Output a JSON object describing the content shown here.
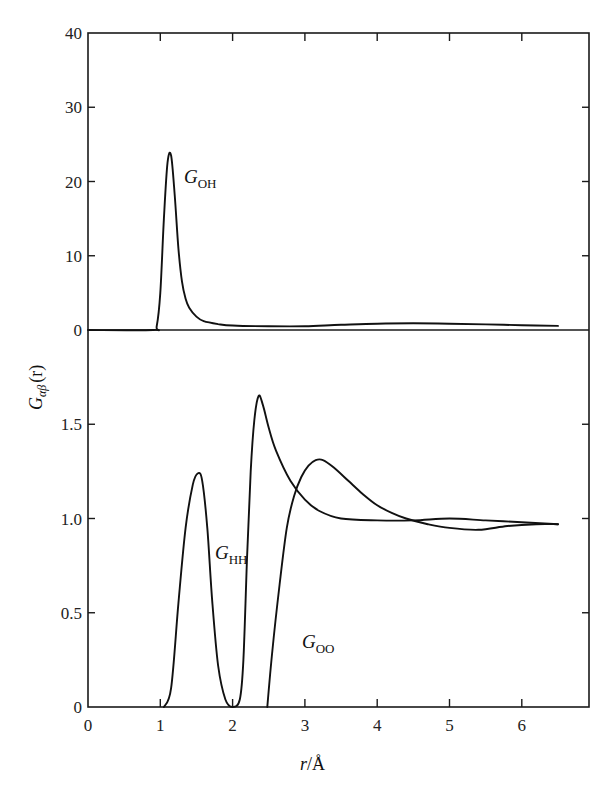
{
  "chart_data": {
    "type": "line",
    "title": "",
    "xlabel": "r/Å",
    "ylabel": "G_αβ(r)",
    "xlim": [
      0,
      6.5
    ],
    "x_ticks": [
      "0",
      "1",
      "2",
      "3",
      "4",
      "5",
      "6"
    ],
    "grid": false,
    "legend": "inline labels next to curves",
    "panels": [
      {
        "name": "upper",
        "ylim": [
          0,
          40
        ],
        "y_ticks": [
          "0",
          "10",
          "20",
          "30",
          "40"
        ],
        "series": [
          {
            "name": "G_OH",
            "label_main": "G",
            "label_sub": "OH",
            "x": [
              0.0,
              0.9,
              0.95,
              1.0,
              1.05,
              1.1,
              1.15,
              1.2,
              1.25,
              1.3,
              1.35,
              1.4,
              1.5,
              1.6,
              1.8,
              2.0,
              2.5,
              3.0,
              3.5,
              4.0,
              4.5,
              5.0,
              5.5,
              6.0,
              6.5
            ],
            "y": [
              0.0,
              0.0,
              0.5,
              5.0,
              15.0,
              22.5,
              23.5,
              18.0,
              11.0,
              6.5,
              4.2,
              3.0,
              1.8,
              1.2,
              0.8,
              0.6,
              0.5,
              0.5,
              0.7,
              0.85,
              0.9,
              0.85,
              0.75,
              0.65,
              0.55
            ]
          }
        ]
      },
      {
        "name": "lower",
        "ylim": [
          0,
          2.0
        ],
        "y_ticks": [
          "0",
          "0.5",
          "1.0",
          "1.5"
        ],
        "series": [
          {
            "name": "G_HH",
            "label_main": "G",
            "label_sub": "HH",
            "x": [
              1.05,
              1.15,
              1.25,
              1.35,
              1.45,
              1.52,
              1.58,
              1.65,
              1.72,
              1.8,
              1.9,
              2.0,
              2.1,
              2.15,
              2.2,
              2.25,
              2.3,
              2.36,
              2.42,
              2.5,
              2.6,
              2.8,
              3.0,
              3.2,
              3.5,
              4.0,
              4.5,
              5.0,
              5.5,
              6.0,
              6.5
            ],
            "y": [
              0.0,
              0.1,
              0.55,
              0.95,
              1.18,
              1.24,
              1.2,
              0.95,
              0.55,
              0.22,
              0.04,
              0.0,
              0.04,
              0.25,
              0.8,
              1.25,
              1.52,
              1.65,
              1.6,
              1.48,
              1.36,
              1.2,
              1.1,
              1.04,
              1.0,
              0.99,
              0.99,
              1.0,
              0.99,
              0.98,
              0.97
            ]
          },
          {
            "name": "G_OO",
            "label_main": "G",
            "label_sub": "OO",
            "x": [
              2.48,
              2.55,
              2.65,
              2.75,
              2.85,
              2.95,
              3.05,
              3.15,
              3.25,
              3.4,
              3.6,
              3.8,
              4.0,
              4.2,
              4.4,
              4.7,
              5.0,
              5.4,
              5.8,
              6.2,
              6.5
            ],
            "y": [
              0.0,
              0.3,
              0.65,
              0.95,
              1.12,
              1.22,
              1.28,
              1.31,
              1.31,
              1.27,
              1.2,
              1.13,
              1.07,
              1.03,
              1.0,
              0.97,
              0.95,
              0.94,
              0.96,
              0.97,
              0.97
            ]
          }
        ]
      }
    ]
  },
  "labels": {
    "ylabel_main": "G",
    "ylabel_sub": "αβ",
    "ylabel_arg": "(r)",
    "xlabel_r": "r",
    "xlabel_unit": "/Å"
  }
}
